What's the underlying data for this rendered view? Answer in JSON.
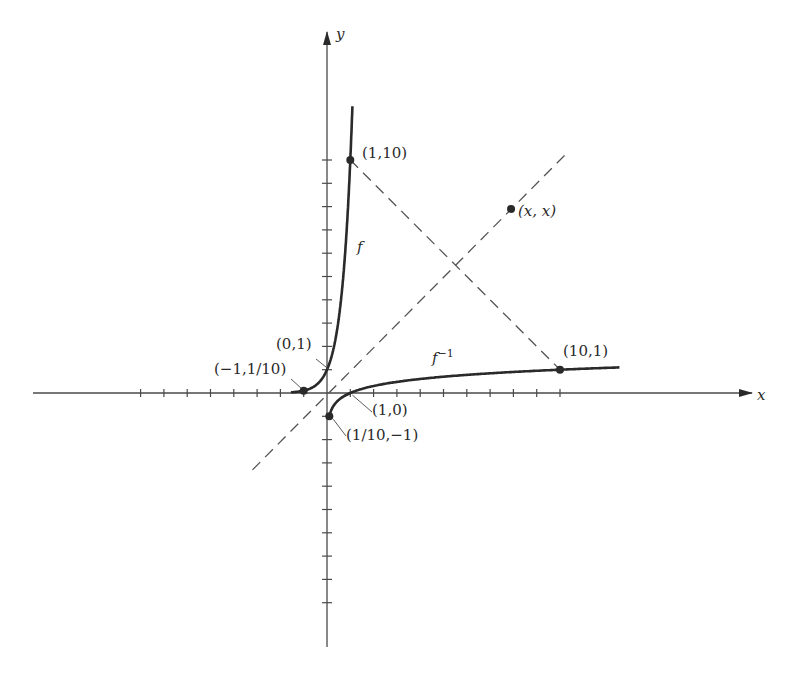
{
  "chart_data": {
    "type": "line",
    "title": "",
    "xlabel": "x",
    "ylabel": "y",
    "xlim": [
      -12.5,
      18.3
    ],
    "ylim": [
      -10.8,
      15.2
    ],
    "grid": false,
    "legend": null,
    "tick_spacing": 1,
    "x_ticks_left": [
      -8,
      -7,
      -6,
      -5,
      -4,
      -3,
      -2,
      -1
    ],
    "x_ticks_right": [
      1,
      2,
      3,
      4,
      5,
      6,
      7,
      8,
      9,
      10
    ],
    "y_ticks_up": [
      1,
      2,
      3,
      4,
      5,
      6,
      7,
      8,
      9,
      10
    ],
    "y_ticks_down": [
      -1,
      -2,
      -3,
      -4,
      -5,
      -6,
      -7,
      -8,
      -9
    ],
    "series": [
      {
        "name": "f",
        "label": "f",
        "formula": "y = 10^x",
        "style": "solid-thick",
        "x": [
          -1.5,
          -1,
          -0.5,
          0,
          0.25,
          0.5,
          0.75,
          0.9,
          1,
          1.1
        ],
        "y": [
          0.032,
          0.1,
          0.316,
          1,
          1.78,
          3.16,
          5.62,
          7.94,
          10,
          12.4
        ]
      },
      {
        "name": "f_inverse",
        "label": "f⁻¹",
        "formula": "y = log10(x)",
        "style": "solid-thick",
        "x": [
          0.1,
          0.2,
          0.5,
          1,
          2,
          3,
          5,
          7,
          10,
          12.6
        ],
        "y": [
          -1,
          -0.7,
          -0.3,
          0,
          0.3,
          0.48,
          0.7,
          0.85,
          1,
          1.1
        ]
      },
      {
        "name": "identity",
        "label": "y = x",
        "style": "dashed",
        "x": [
          -3.2,
          10.2
        ],
        "y": [
          -3.3,
          10.2
        ]
      },
      {
        "name": "reflection-segment",
        "label": "",
        "style": "dashed",
        "x": [
          1,
          10
        ],
        "y": [
          10,
          1
        ]
      }
    ],
    "points": [
      {
        "label": "(1,10)",
        "x": 1,
        "y": 10
      },
      {
        "label": "(x, x)",
        "x": 7.9,
        "y": 7.9
      },
      {
        "label": "(10,1)",
        "x": 10,
        "y": 1
      },
      {
        "label": "(0,1)",
        "x": 0,
        "y": 1
      },
      {
        "label": "(-1,1/10)",
        "x": -1,
        "y": 0.1
      },
      {
        "label": "(1,0)",
        "x": 1,
        "y": 0
      },
      {
        "label": "(1/10,-1)",
        "x": 0.1,
        "y": -1
      }
    ],
    "annotations": [
      {
        "text": "f",
        "near": [
          1.3,
          6.5
        ]
      },
      {
        "text": "f⁻¹",
        "near": [
          4.0,
          1.6
        ]
      }
    ]
  },
  "labels": {
    "axis_x": "x",
    "axis_y": "y",
    "f": "f",
    "f_inv_base": "f",
    "f_inv_sup": "−1",
    "p_1_10": "(1,10)",
    "p_xx": "(x, x)",
    "p_10_1": "(10,1)",
    "p_0_1": "(0,1)",
    "p_m1_1_10": "(−1,1/10)",
    "p_1_0": "(1,0)",
    "p_1_10_m1": "(1/10,−1)"
  },
  "geometry": {
    "origin_px": [
      327,
      393
    ],
    "unit_px": 23.3,
    "x_axis_px": [
      33,
      752
    ],
    "y_axis_px": [
      32,
      647
    ]
  },
  "colors": {
    "ink": "#2a2a2a",
    "axis": "#4a4a4a",
    "dash": "#555555",
    "background": "#ffffff"
  }
}
